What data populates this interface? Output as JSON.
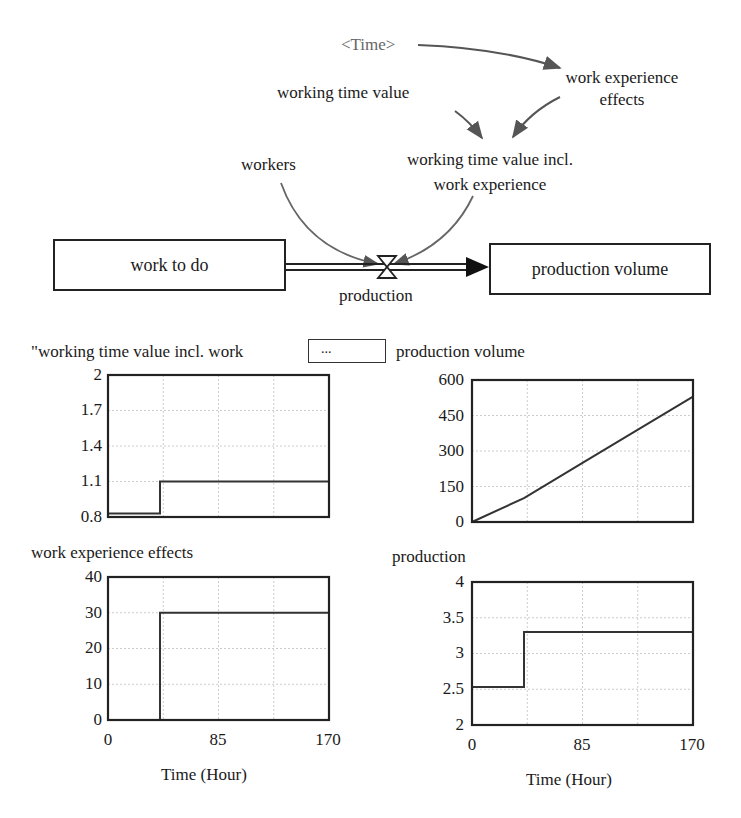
{
  "diagram": {
    "nodes": {
      "time": "<Time>",
      "work_experience_effects_line1": "work experience",
      "work_experience_effects_line2": "effects",
      "working_time_value": "working time value",
      "wtv_incl_line1": "working time value incl.",
      "wtv_incl_line2": "work experience",
      "workers": "workers",
      "work_to_do": "work to do",
      "production_volume": "production volume",
      "production": "production"
    },
    "colors": {
      "arrow": "#555555",
      "line": "#222222",
      "grid": "#cccccc",
      "series": "#333333"
    }
  },
  "panel": {
    "chart1_title": "\"working time value incl. work",
    "ellipsis_button": "...",
    "chart2_title": "production volume",
    "chart3_title": "work experience effects",
    "chart4_title": "production",
    "xlabel": "Time (Hour)"
  },
  "chart_data": [
    {
      "type": "line",
      "title": "\"working time value incl. work experience\"",
      "xlabel": "",
      "ylabel": "",
      "xlim": [
        0,
        170
      ],
      "ylim": [
        0.8,
        2
      ],
      "yticks": [
        "2",
        "1.7",
        "1.4",
        "1.1",
        "0.8"
      ],
      "xticks": [],
      "grid": true,
      "series": [
        {
          "name": "working time value incl. work experience",
          "x": [
            0,
            40,
            40,
            170
          ],
          "values": [
            0.83,
            0.83,
            1.1,
            1.1
          ]
        }
      ]
    },
    {
      "type": "line",
      "title": "production volume",
      "xlabel": "",
      "ylabel": "",
      "xlim": [
        0,
        170
      ],
      "ylim": [
        0,
        600
      ],
      "yticks": [
        "600",
        "450",
        "300",
        "150",
        "0"
      ],
      "xticks": [],
      "grid": true,
      "series": [
        {
          "name": "production volume",
          "x": [
            0,
            40,
            85,
            127,
            170
          ],
          "values": [
            0,
            101,
            250,
            388,
            530
          ]
        }
      ]
    },
    {
      "type": "line",
      "title": "work experience effects",
      "xlabel": "Time (Hour)",
      "ylabel": "",
      "xlim": [
        0,
        170
      ],
      "ylim": [
        0,
        40
      ],
      "yticks": [
        "40",
        "30",
        "20",
        "10",
        "0"
      ],
      "xticks": [
        "0",
        "85",
        "170"
      ],
      "grid": true,
      "series": [
        {
          "name": "work experience effects",
          "x": [
            0,
            40,
            40,
            170
          ],
          "values": [
            0,
            0,
            30,
            30
          ]
        }
      ]
    },
    {
      "type": "line",
      "title": "production",
      "xlabel": "Time (Hour)",
      "ylabel": "",
      "xlim": [
        0,
        170
      ],
      "ylim": [
        2,
        4
      ],
      "yticks": [
        "4",
        "3.5",
        "3",
        "2.5",
        "2"
      ],
      "xticks": [
        "0",
        "85",
        "170"
      ],
      "grid": true,
      "series": [
        {
          "name": "production",
          "x": [
            0,
            40,
            40,
            170
          ],
          "values": [
            2.53,
            2.53,
            3.3,
            3.3
          ]
        }
      ]
    }
  ]
}
